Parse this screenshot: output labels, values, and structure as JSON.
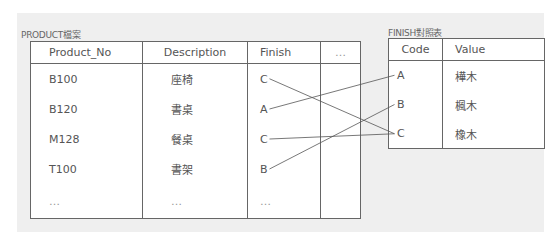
{
  "product_table": {
    "title": "PRODUCT檔案",
    "headers": [
      "Product_No",
      "Description",
      "Finish",
      "…"
    ],
    "rows": [
      [
        "B100",
        "座椅",
        "C",
        ""
      ],
      [
        "B120",
        "書桌",
        "A",
        ""
      ],
      [
        "M128",
        "餐桌",
        "C",
        ""
      ],
      [
        "T100",
        "書架",
        "B",
        ""
      ],
      [
        "…",
        "…",
        "…",
        ""
      ]
    ]
  },
  "finish_table": {
    "title": "FINISH對照表",
    "headers": [
      "Code",
      "Value"
    ],
    "rows": [
      [
        "A",
        "樺木"
      ],
      [
        "B",
        "楓木"
      ],
      [
        "C",
        "橡木"
      ]
    ]
  },
  "links": [
    {
      "from_row": 0,
      "to_code": "C"
    },
    {
      "from_row": 1,
      "to_code": "A"
    },
    {
      "from_row": 2,
      "to_code": "C"
    },
    {
      "from_row": 3,
      "to_code": "B"
    }
  ]
}
